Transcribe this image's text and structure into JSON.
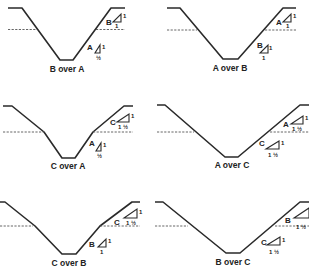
{
  "colors": {
    "line": "#2a2a2a",
    "water": "#555555",
    "background": "#ffffff"
  },
  "panels": [
    {
      "caption": "B over A",
      "upper_layer": {
        "label": "B",
        "slope_rise": "1",
        "slope_run": "1"
      },
      "lower_layer": {
        "label": "A",
        "slope_rise": "1",
        "slope_run": "½"
      }
    },
    {
      "caption": "A over B",
      "upper_layer": {
        "label": "A",
        "slope_rise": "1",
        "slope_run": "1"
      },
      "lower_layer": {
        "label": "B",
        "slope_rise": "1",
        "slope_run": "1"
      }
    },
    {
      "caption": "C over A",
      "upper_layer": {
        "label": "C",
        "slope_rise": "1",
        "slope_run": "1 ½"
      },
      "lower_layer": {
        "label": "A",
        "slope_rise": "1",
        "slope_run": "½"
      }
    },
    {
      "caption": "A over C",
      "upper_layer": {
        "label": "A",
        "slope_rise": "1",
        "slope_run": "1 ½"
      },
      "lower_layer": {
        "label": "C",
        "slope_rise": "1",
        "slope_run": "1 ½"
      }
    },
    {
      "caption": "C over B",
      "upper_layer": {
        "label": "C",
        "slope_rise": "1",
        "slope_run": "1 ½"
      },
      "lower_layer": {
        "label": "B",
        "slope_rise": "1",
        "slope_run": "1"
      }
    },
    {
      "caption": "B over C",
      "upper_layer": {
        "label": "B",
        "slope_rise": "1",
        "slope_run": "1 ½"
      },
      "lower_layer": {
        "label": "C",
        "slope_rise": "1",
        "slope_run": "1 ½"
      }
    }
  ]
}
